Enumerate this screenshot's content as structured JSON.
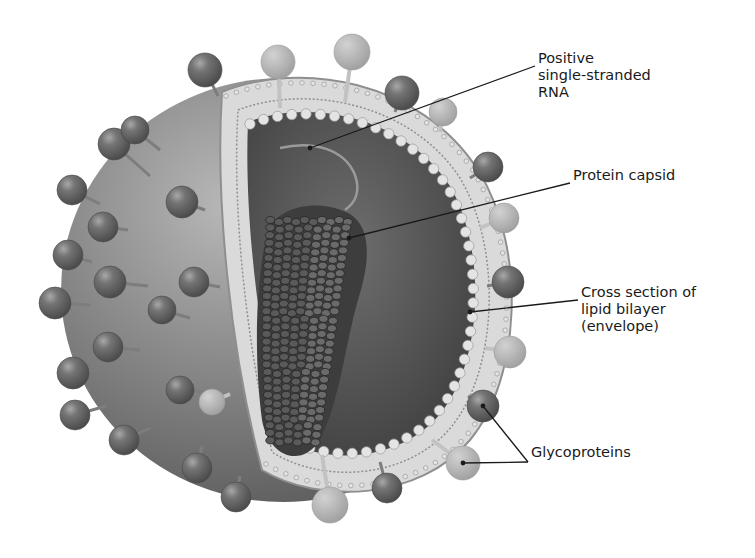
{
  "diagram": {
    "labels": {
      "rna": {
        "lines": [
          "Positive",
          "single-stranded",
          "RNA"
        ],
        "text_x": 538,
        "text_y": 58,
        "leader": [
          [
            535,
            66
          ],
          [
            310,
            148
          ]
        ]
      },
      "capsid": {
        "lines": [
          "Protein capsid"
        ],
        "text_x": 573,
        "text_y": 175,
        "leader": [
          [
            570,
            183
          ],
          [
            349,
            238
          ]
        ]
      },
      "envelope": {
        "lines": [
          "Cross section of",
          "lipid bilayer",
          "(envelope)"
        ],
        "text_x": 581,
        "text_y": 292,
        "leader": [
          [
            578,
            300
          ],
          [
            470,
            312
          ]
        ]
      },
      "glycoproteins": {
        "lines": [
          "Glycoproteins"
        ],
        "text_x": 531,
        "text_y": 452,
        "leader_apex": [
          528,
          462
        ],
        "leader_targets": [
          [
            483,
            406
          ],
          [
            463,
            463
          ]
        ]
      }
    },
    "colors": {
      "background": "#ffffff",
      "sphere_light": "#b3b3b3",
      "sphere_mid": "#8a8a8a",
      "sphere_dark": "#5e5e5e",
      "interior": "#4f4f4f",
      "interior_light": "#6e6e6e",
      "envelope_band": "#dadada",
      "envelope_edge": "#8f8f8f",
      "bead": "#e4e4e4",
      "bead_edge": "#9a9a9a",
      "capsid": "#3d3d3d",
      "capsid_scale": "#5a5a5a",
      "capsid_scale_edge": "#262626",
      "spike_dark": "#6a6a6a",
      "spike_light": "#b8b8b8",
      "stalk": "#7d7d7d",
      "stalk_light": "#c2c2c2",
      "leader_line": "#1a1a1a",
      "label_text": "#1a1a1a"
    }
  }
}
